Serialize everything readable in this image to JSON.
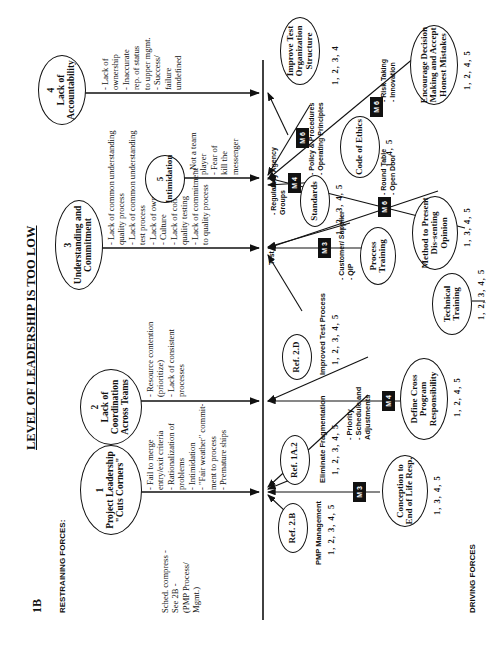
{
  "page_id": "1B",
  "title": "LEVEL OF LEADERSHIP IS TOO LOW",
  "restraining_label": "RESTRAINING FORCES:",
  "driving_label": "DRIVING FORCES",
  "restraining": [
    {
      "num": "1",
      "name": "Project Leadership \"Cuts Corners\"",
      "side_note": "Sched. compress -\nSee 2B -\n(PMP Process/\nMgmt.)",
      "items": "- Fail to merge\n  entry/exit criteria\n- Rationalization of\n  problems\n- Intimidation\n- \"Fair weather\" commit-\n  ment to process\n- Premature ships"
    },
    {
      "num": "2",
      "name": "Lack of Coordination Across Teams",
      "items": "- Resource contention\n  (prioritize)\n- Lack of consistent\n  processes"
    },
    {
      "num": "3",
      "name": "Understanding and Commitment",
      "items": "- Lack of common understanding\n  quality process\n- Lack of common understanding\n  test process\n- Lack of ownership\n- Culture\n- Lack of commitment to\n  quality testing\n- Lack of commitment\n  to quality process"
    },
    {
      "num": "5",
      "name": "Intimidation",
      "items": "- Not a team\n  player\n- Fear of\n  kill the\n  messenger"
    },
    {
      "num": "4",
      "name": "Lack of Accountability",
      "items": "- Lack of\n  ownership\n- Inaccurate\n  rep. of status\n  to upper mgmt.\n- Success/\n  failure\n  undefined"
    }
  ],
  "driving": {
    "ref_2b": {
      "name": "Ref. 2.B",
      "caption": "PMP Management",
      "nums": "1, 2, 3, 4, 5"
    },
    "ref_1a2": {
      "name": "Ref. 1A.2",
      "caption": "Eliminate Fragmentation",
      "nums": "1, 2, 3, 4, 5"
    },
    "conception": {
      "name": "Conception to End of Life Resp.",
      "m": "M 3",
      "nums": "1, 3, 4, 5"
    },
    "cross_program": {
      "name": "Define Cross Program Responsibility",
      "m": "M 4",
      "notes": "- Priority\n- Schedule and\n  Adjustments",
      "nums": "1, 2, 4, 5"
    },
    "ref_2d": {
      "name": "Ref. 2.D",
      "caption": "Improved Test Process",
      "nums": "1, 2, 3, 4, 5"
    },
    "process_training": {
      "name": "Process Training",
      "m": "M 3",
      "notes": "- Customer/ Supplier\n- QIP",
      "test_label": "Test"
    },
    "technical_training": {
      "name": "Technical Training",
      "nums": "1, 2, 3, 4, 5"
    },
    "standards": {
      "name": "Standards",
      "m": "M 4",
      "notes": "- Regulatory Agency\n  Groups",
      "nums": "1, 2, 3, 4, 5"
    },
    "dissent": {
      "name": "Method to Present Dis-senting Opinion",
      "m": "M 6",
      "notes": "- Round Table\n- Open Door",
      "nums": "1, 3, 4, 5"
    },
    "ethics": {
      "name": "Code of Ethics",
      "m": "M 6",
      "notes": "- Policy & Procedures\n- Operating Principles",
      "nums": "1, 4, 5"
    },
    "decision": {
      "name": "Encourage Decision Making and Accept Honest Mistakes",
      "m": "M 6",
      "notes": "- Risk Taking\n- Innovation",
      "nums": "1, 2, 4, 5"
    },
    "test_org": {
      "name": "Improve Test Organization Structure",
      "nums": "1, 2, 3, 4"
    }
  }
}
